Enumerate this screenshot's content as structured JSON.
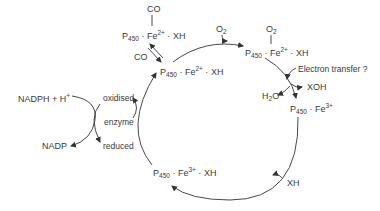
{
  "diagram": {
    "nodes": {
      "co_complex": {
        "ligand": "CO",
        "p": "P",
        "p_sub": "450",
        "fe": "Fe",
        "fe_sup": "2+",
        "tail": "XH"
      },
      "fe2_xh": {
        "p": "P",
        "p_sub": "450",
        "fe": "Fe",
        "fe_sup": "2+",
        "tail": "XH"
      },
      "o2_complex": {
        "ligand": "O",
        "ligand_sub": "2",
        "p": "P",
        "p_sub": "450",
        "fe": "Fe",
        "fe_sup": "2+",
        "tail": "XH"
      },
      "fe3": {
        "p": "P",
        "p_sub": "450",
        "fe": "Fe",
        "fe_sup": "3+"
      },
      "fe3_xh": {
        "p": "P",
        "p_sub": "450",
        "fe": "Fe",
        "fe_sup": "3+",
        "tail": "XH"
      }
    },
    "labels": {
      "co_in": "CO",
      "o2_in": "O",
      "o2_in_sub": "2",
      "electron_transfer": "Electron transfer ?",
      "xoh": "XOH",
      "h2o_h": "H",
      "h2o_sub": "2",
      "h2o_o": "O",
      "xh_in": "XH",
      "nadph": "NADPH + H",
      "nadph_sup": "+",
      "nadp": "NADP",
      "oxidised": "oxidised",
      "enzyme": "enzyme",
      "reduced": "reduced"
    },
    "dot": "·",
    "line_color": "#333333"
  }
}
